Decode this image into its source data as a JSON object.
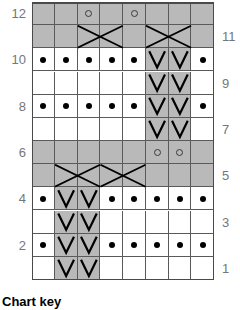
{
  "chart_data": {
    "type": "table",
    "rows": 12,
    "columns": 8,
    "row_labels_left": [
      "12",
      "10",
      "8",
      "6",
      "4",
      "2"
    ],
    "row_labels_right": [
      "11",
      "9",
      "7",
      "5",
      "3",
      "1"
    ],
    "legend_heading": "Chart key",
    "symbol_names": {
      "blank": "blank",
      "purl": "purl-dot",
      "yarnover": "yarn-over-circle",
      "slip": "slip-stitch-v",
      "cable": "cable-cross"
    },
    "colors": {
      "cell_white": "#ffffff",
      "cell_gray": "#b9b9b9",
      "grid_line": "#5a5a5a",
      "grid_border": "#4a4a4a",
      "symbol": "#000000",
      "label_text": "#767676"
    },
    "grid": [
      {
        "row": 12,
        "cells": [
          "gray",
          "gray",
          "gray-yo",
          "gray",
          "gray-yo",
          "gray",
          "gray",
          "gray"
        ]
      },
      {
        "row": 11,
        "cells": [
          "gray",
          "gray",
          "gray-cableL",
          "gray-cableR",
          "gray",
          "gray-cableL",
          "gray-cableR",
          "gray"
        ]
      },
      {
        "row": 10,
        "cells": [
          "white-dot",
          "white-dot",
          "white-dot",
          "white-dot",
          "white-dot",
          "gray-v",
          "gray-v",
          "white-dot"
        ]
      },
      {
        "row": 9,
        "cells": [
          "white",
          "white",
          "white",
          "white",
          "white",
          "gray-v",
          "gray-v",
          "white"
        ]
      },
      {
        "row": 8,
        "cells": [
          "white-dot",
          "white-dot",
          "white-dot",
          "white-dot",
          "white-dot",
          "gray-v",
          "gray-v",
          "white-dot"
        ]
      },
      {
        "row": 7,
        "cells": [
          "white",
          "white",
          "white",
          "white",
          "white",
          "gray-v",
          "gray-v",
          "white"
        ]
      },
      {
        "row": 6,
        "cells": [
          "gray",
          "gray",
          "gray",
          "gray",
          "gray",
          "gray-yo",
          "gray-yo",
          "gray"
        ]
      },
      {
        "row": 5,
        "cells": [
          "gray",
          "gray-cableL",
          "gray-cableR",
          "gray-cableL",
          "gray-cableR",
          "gray",
          "gray",
          "gray"
        ]
      },
      {
        "row": 4,
        "cells": [
          "white-dot",
          "gray-v",
          "gray-v",
          "white-dot",
          "white-dot",
          "white-dot",
          "white-dot",
          "white-dot"
        ]
      },
      {
        "row": 3,
        "cells": [
          "white",
          "gray-v",
          "gray-v",
          "white",
          "white",
          "white",
          "white",
          "white"
        ]
      },
      {
        "row": 2,
        "cells": [
          "white-dot",
          "gray-v",
          "gray-v",
          "white-dot",
          "white-dot",
          "white-dot",
          "white-dot",
          "white-dot"
        ]
      },
      {
        "row": 1,
        "cells": [
          "white",
          "gray-v",
          "gray-v",
          "white",
          "white",
          "white",
          "white",
          "white"
        ]
      }
    ],
    "labels_left": [
      {
        "text": "12",
        "row": 12
      },
      {
        "text": "10",
        "row": 10
      },
      {
        "text": "8",
        "row": 8
      },
      {
        "text": "6",
        "row": 6
      },
      {
        "text": "4",
        "row": 4
      },
      {
        "text": "2",
        "row": 2
      }
    ],
    "labels_right": [
      {
        "text": "11",
        "row": 11
      },
      {
        "text": "9",
        "row": 9
      },
      {
        "text": "7",
        "row": 7
      },
      {
        "text": "5",
        "row": 5
      },
      {
        "text": "3",
        "row": 3
      },
      {
        "text": "1",
        "row": 1
      }
    ]
  },
  "footer": {
    "chart_key_label": "Chart key"
  }
}
